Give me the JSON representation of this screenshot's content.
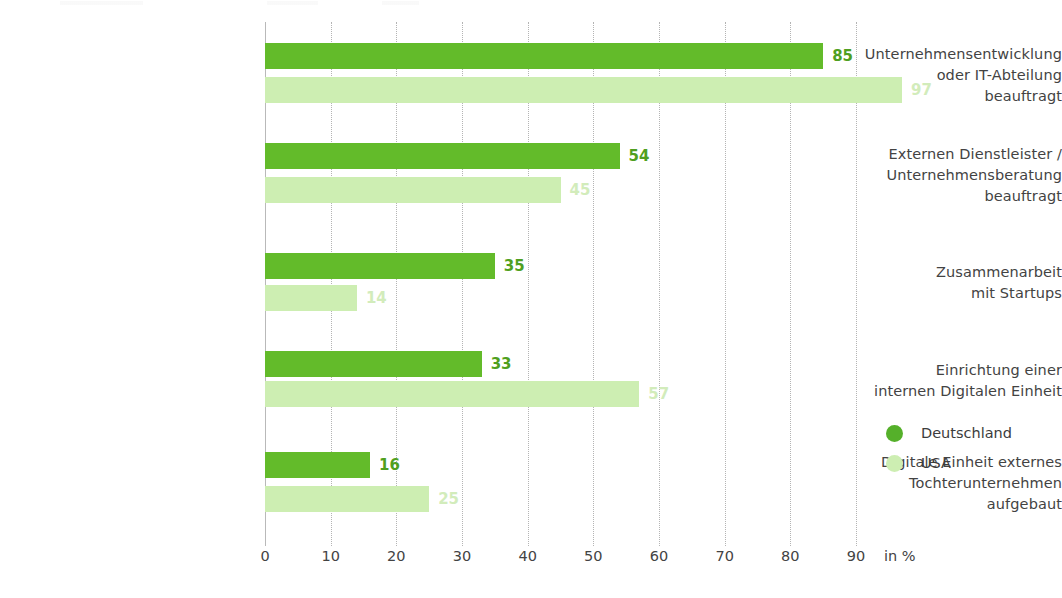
{
  "chart_data": {
    "type": "bar",
    "orientation": "horizontal",
    "title": "",
    "xlabel": "in %",
    "ylabel": "",
    "xlim": [
      0,
      90
    ],
    "xticks": [
      0,
      10,
      20,
      30,
      40,
      50,
      60,
      70,
      80,
      90
    ],
    "grid": true,
    "legend_position": "right",
    "categories": [
      "Unternehmensentwicklung oder IT-Abteilung beauftragt",
      "Externen Dienstleister / Unternehmensberatung beauftragt",
      "Zusammenarbeit mit Startups",
      "Einrichtung einer internen Digitalen Einheit",
      "Digitale Einheit externes Tochterunternehmen aufgebaut"
    ],
    "category_lines": [
      [
        "Unternehmensentwicklung",
        "oder IT-Abteilung",
        "beauftragt"
      ],
      [
        "Externen Dienstleister /",
        "Unternehmensberatung",
        "beauftragt"
      ],
      [
        "Zusammenarbeit",
        "mit Startups"
      ],
      [
        "Einrichtung einer",
        "internen Digitalen Einheit"
      ],
      [
        "Digitale Einheit externes",
        "Tochterunternehmen",
        "aufgebaut"
      ]
    ],
    "series": [
      {
        "name": "Deutschland",
        "color": "#63bb2a",
        "values": [
          85,
          54,
          35,
          33,
          16
        ]
      },
      {
        "name": "USA",
        "color": "#cdeeb2",
        "values": [
          97,
          45,
          14,
          57,
          25
        ]
      }
    ]
  },
  "axis": {
    "unit_label": "in %",
    "tick_labels": [
      "0",
      "10",
      "20",
      "30",
      "40",
      "50",
      "60",
      "70",
      "80",
      "90"
    ]
  },
  "legend": {
    "items": [
      {
        "label": "Deutschland",
        "color": "#63bb2a"
      },
      {
        "label": "USA",
        "color": "#cdeeb2"
      }
    ]
  },
  "colors": {
    "germany": "#63bb2a",
    "usa": "#cdeeb2",
    "germany_label": "#4f9f20",
    "usa_label": "#d2ecbb",
    "text": "#434343",
    "gridline": "#b4b4b4",
    "axis": "#b9b9b9",
    "background": "#ffffff"
  }
}
